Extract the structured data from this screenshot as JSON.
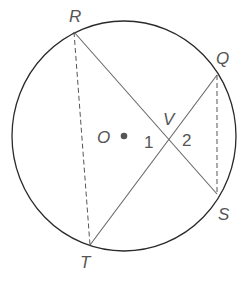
{
  "diagram": {
    "type": "circle-intersecting-chords",
    "colors": {
      "circle": "#2a2a2a",
      "chord": "#666666",
      "dashed": "#555555",
      "label": "#555555",
      "center_dot": "#555555"
    },
    "circle": {
      "center_label": "O",
      "cx": 124,
      "cy": 136,
      "rx": 112,
      "ry": 115
    },
    "points": {
      "R": {
        "label": "R",
        "x": 74,
        "y": 32
      },
      "Q": {
        "label": "Q",
        "x": 217,
        "y": 75
      },
      "S": {
        "label": "S",
        "x": 217,
        "y": 194
      },
      "T": {
        "label": "T",
        "x": 90,
        "y": 245
      },
      "V": {
        "label": "V",
        "x": 170,
        "y": 141
      }
    },
    "segments": {
      "solid": [
        "RS",
        "QT"
      ],
      "dashed": [
        "RT",
        "QS"
      ]
    },
    "angles": {
      "angle1": "1",
      "angle2": "2"
    }
  }
}
